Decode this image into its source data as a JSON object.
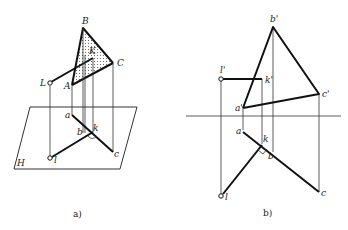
{
  "figure_a": {
    "caption": "a)",
    "plane_label": "H",
    "space_points": {
      "B": "B",
      "C": "C",
      "A": "A",
      "K": "K",
      "L": "L"
    },
    "projection_points": {
      "a": "a",
      "b": "b",
      "k": "k",
      "c": "c",
      "l": "l"
    }
  },
  "figure_b": {
    "caption": "b)",
    "front_points": {
      "b": "b'",
      "c": "c'",
      "a": "a'",
      "l": "l'",
      "k": "k'"
    },
    "top_points": {
      "a": "a",
      "k": "k",
      "b": "b",
      "c": "c",
      "l": "l"
    }
  },
  "colors": {
    "line": "#111111",
    "background": "#ffffff",
    "dots": "#555555"
  }
}
